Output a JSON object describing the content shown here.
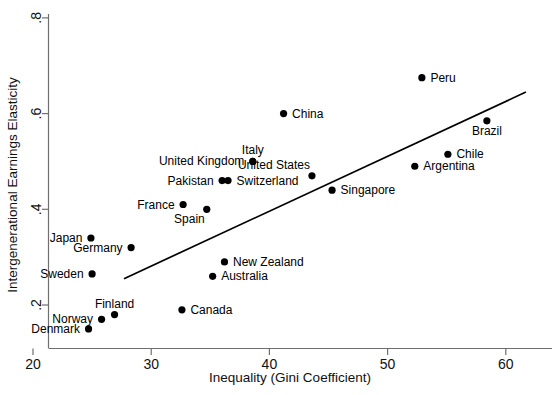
{
  "chart_data": {
    "type": "scatter",
    "title": "",
    "xlabel": "Inequality (Gini Coefficient)",
    "ylabel": "Intergenerational Earnings Elasticity",
    "xlim": [
      20,
      61.5
    ],
    "ylim": [
      0.145,
      0.8
    ],
    "xticks": [
      20,
      30,
      40,
      50,
      60
    ],
    "xticklabels": [
      "20",
      "30",
      "40",
      "50",
      "60"
    ],
    "yticks": [
      0.2,
      0.4,
      0.6,
      0.8
    ],
    "yticklabels": [
      ".2",
      ".4",
      ".6",
      ".8"
    ],
    "grid": false,
    "legend": "none",
    "points": [
      {
        "label": "Denmark",
        "x": 24.7,
        "y": 0.15,
        "label_pos": "left"
      },
      {
        "label": "Norway",
        "x": 25.8,
        "y": 0.17,
        "label_pos": "left"
      },
      {
        "label": "Finland",
        "x": 26.9,
        "y": 0.18,
        "label_pos": "above"
      },
      {
        "label": "Sweden",
        "x": 25.0,
        "y": 0.265,
        "label_pos": "left"
      },
      {
        "label": "Canada",
        "x": 32.6,
        "y": 0.19,
        "label_pos": "right"
      },
      {
        "label": "Australia",
        "x": 35.2,
        "y": 0.26,
        "label_pos": "right"
      },
      {
        "label": "New Zealand",
        "x": 36.2,
        "y": 0.29,
        "label_pos": "right"
      },
      {
        "label": "Germany",
        "x": 28.3,
        "y": 0.32,
        "label_pos": "left"
      },
      {
        "label": "Japan",
        "x": 24.9,
        "y": 0.34,
        "label_pos": "left"
      },
      {
        "label": "Spain",
        "x": 34.7,
        "y": 0.4,
        "label_pos": "below-left"
      },
      {
        "label": "France",
        "x": 32.7,
        "y": 0.41,
        "label_pos": "left"
      },
      {
        "label": "Pakistan",
        "x": 36.0,
        "y": 0.46,
        "label_pos": "left"
      },
      {
        "label": "Switzerland",
        "x": 36.5,
        "y": 0.46,
        "label_pos": "right"
      },
      {
        "label": "Singapore",
        "x": 45.3,
        "y": 0.44,
        "label_pos": "right"
      },
      {
        "label": "United States",
        "x": 43.6,
        "y": 0.47,
        "label_pos": "above-left"
      },
      {
        "label": "United Kingdom",
        "x": 38.6,
        "y": 0.5,
        "label_pos": "left"
      },
      {
        "label": "Italy",
        "x": 38.6,
        "y": 0.5,
        "label_pos": "above"
      },
      {
        "label": "Argentina",
        "x": 52.3,
        "y": 0.49,
        "label_pos": "right"
      },
      {
        "label": "Chile",
        "x": 55.1,
        "y": 0.515,
        "label_pos": "right"
      },
      {
        "label": "China",
        "x": 41.2,
        "y": 0.6,
        "label_pos": "right"
      },
      {
        "label": "Brazil",
        "x": 58.4,
        "y": 0.585,
        "label_pos": "below"
      },
      {
        "label": "Peru",
        "x": 52.9,
        "y": 0.675,
        "label_pos": "right"
      }
    ],
    "fit_line": {
      "x1": 27.7,
      "y1": 0.255,
      "x2": 61.7,
      "y2": 0.645
    }
  }
}
